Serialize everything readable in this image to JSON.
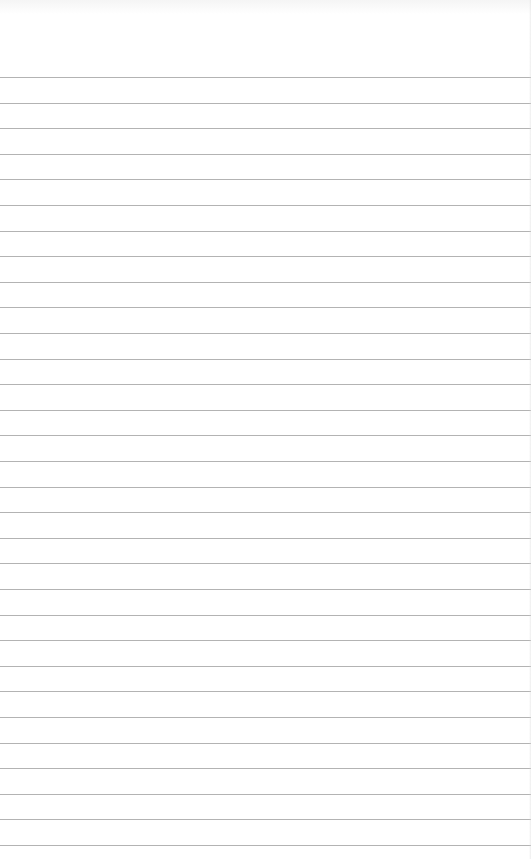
{
  "document": {
    "type": "lined-paper",
    "background_color": "#ffffff",
    "rule_color": "#9a9a9a",
    "rule_count": 31,
    "first_rule_y": 77,
    "rule_spacing": 25.6,
    "text": ""
  }
}
